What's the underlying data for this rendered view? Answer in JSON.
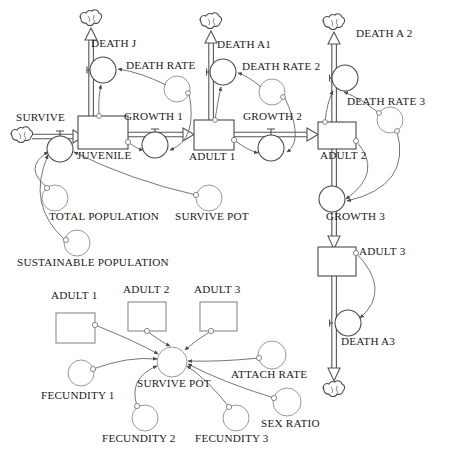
{
  "diagram": {
    "type": "system-dynamics-stock-flow",
    "colors": {
      "stroke": "#4a4a4a",
      "flow_stroke": "#555555",
      "text": "#1a1a1a",
      "background": "#ffffff"
    }
  },
  "stocks": [
    {
      "label": "JUVENILE",
      "x": 78,
      "y": 116,
      "w": 50,
      "h": 33,
      "label_x": 80,
      "label_y": 150
    },
    {
      "label": "ADULT 1",
      "x": 194,
      "y": 120,
      "w": 40,
      "h": 30,
      "label_x": 190,
      "label_y": 151
    },
    {
      "label": "ADULT 2",
      "x": 318,
      "y": 122,
      "w": 38,
      "h": 27,
      "label_x": 322,
      "label_y": 150
    },
    {
      "label": "ADULT 3",
      "x": 318,
      "y": 247,
      "w": 38,
      "h": 29,
      "label_x": 360,
      "label_y": 246
    }
  ],
  "ghost_stocks": [
    {
      "label": "ADULT 1",
      "x": 56,
      "y": 302,
      "w": 39,
      "h": 30,
      "label_x": 52,
      "label_y": 290
    },
    {
      "label": "ADULT 2",
      "x": 128,
      "y": 296,
      "w": 38,
      "h": 30,
      "label_x": 124,
      "label_y": 284
    },
    {
      "label": "ADULT 3",
      "x": 198,
      "y": 296,
      "w": 36,
      "h": 30,
      "label_x": 194,
      "label_y": 284
    }
  ],
  "flow_valves": [
    {
      "label": "SURVIVE",
      "cx": 60,
      "cy": 149,
      "r": 13,
      "label_x": 16,
      "label_y": 111
    },
    {
      "label": "DEATH J",
      "cx": 103,
      "cy": 70,
      "r": 13,
      "label_x": 91,
      "label_y": 37
    },
    {
      "label": "GROWTH 1",
      "cx": 155,
      "cy": 145,
      "r": 13,
      "label_x": 125,
      "label_y": 110
    },
    {
      "label": "DEATH A1",
      "cx": 223,
      "cy": 72,
      "r": 13,
      "label_x": 218,
      "label_y": 38
    },
    {
      "label": "GROWTH 2",
      "cx": 271,
      "cy": 148,
      "r": 13,
      "label_x": 244,
      "label_y": 111
    },
    {
      "label": "DEATH A 2",
      "cx": 345,
      "cy": 78,
      "r": 13,
      "label_x": 355,
      "label_y": 26
    },
    {
      "label": "GROWTH 3",
      "cx": 332,
      "cy": 199,
      "r": 13,
      "label_x": 327,
      "label_y": 211
    },
    {
      "label": "DEATH A3",
      "cx": 348,
      "cy": 323,
      "r": 13,
      "label_x": 342,
      "label_y": 336
    }
  ],
  "variables": [
    {
      "label": "DEATH RATE",
      "cx": 177,
      "cy": 89,
      "r": 13,
      "label_x": 126,
      "label_y": 60
    },
    {
      "label": "DEATH RATE 2",
      "cx": 272,
      "cy": 92,
      "r": 13,
      "label_x": 243,
      "label_y": 61
    },
    {
      "label": "DEATH RATE 3",
      "cx": 390,
      "cy": 120,
      "r": 13,
      "label_x": 348,
      "label_y": 96
    },
    {
      "label": "TOTAL POPULATION",
      "cx": 55,
      "cy": 198,
      "r": 13,
      "label_x": 50,
      "label_y": 211
    },
    {
      "label": "SURVIVE POT",
      "cx": 209,
      "cy": 198,
      "r": 13,
      "label_x": 176,
      "label_y": 211
    },
    {
      "label": "SUSTAINABLE POPULATION",
      "cx": 77,
      "cy": 243,
      "r": 13,
      "label_x": 18,
      "label_y": 257
    },
    {
      "label": "SURVIVE POT",
      "cx": 172,
      "cy": 362,
      "r": 15,
      "label_x": 138,
      "label_y": 378
    },
    {
      "label": "FECUNDITY 1",
      "cx": 81,
      "cy": 373,
      "r": 13,
      "label_x": 42,
      "label_y": 390
    },
    {
      "label": "FECUNDITY 2",
      "cx": 145,
      "cy": 418,
      "r": 13,
      "label_x": 103,
      "label_y": 433
    },
    {
      "label": "FECUNDITY 3",
      "cx": 236,
      "cy": 418,
      "r": 13,
      "label_x": 196,
      "label_y": 433
    },
    {
      "label": "ATTACH RATE",
      "cx": 272,
      "cy": 355,
      "r": 14,
      "label_x": 232,
      "label_y": 369
    },
    {
      "label": "SEX RATIO",
      "cx": 287,
      "cy": 402,
      "r": 14,
      "label_x": 262,
      "label_y": 418
    }
  ],
  "clouds": [
    {
      "name": "source-cloud-survive",
      "cx": 22,
      "cy": 136
    },
    {
      "name": "sink-cloud-death-j",
      "cx": 86,
      "cy": 20
    },
    {
      "name": "sink-cloud-death-a1",
      "cx": 207,
      "cy": 23
    },
    {
      "name": "sink-cloud-death-a2",
      "cx": 333,
      "cy": 24
    },
    {
      "name": "sink-cloud-death-a3",
      "cx": 339,
      "cy": 378
    }
  ]
}
